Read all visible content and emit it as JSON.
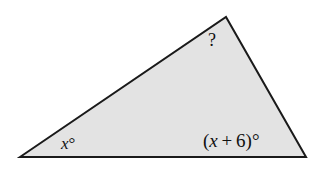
{
  "figure": {
    "kind": "triangle-angle-diagram",
    "background_color": "#ffffff",
    "fill_color": "#e3e3e3",
    "stroke_color": "#1a1a1a",
    "stroke_width": 2,
    "vertices": {
      "left": {
        "x": 20,
        "y": 157
      },
      "apex": {
        "x": 226,
        "y": 17
      },
      "right": {
        "x": 306,
        "y": 157
      }
    },
    "polygon_points": "20,157 226,17 306,157"
  },
  "labels": {
    "apex": {
      "text": "?",
      "meaning": "unknown-angle",
      "x": 208,
      "y": 31
    },
    "left": {
      "variable": "x",
      "degree_symbol": "°",
      "full_text": "x°",
      "x": 61,
      "y": 135
    },
    "right": {
      "open_paren": "(",
      "variable": "x",
      "operator": "+",
      "addend": "6",
      "close_paren": ")",
      "degree_symbol": "°",
      "full_text": "(x + 6)°",
      "x": 203,
      "y": 131
    }
  }
}
